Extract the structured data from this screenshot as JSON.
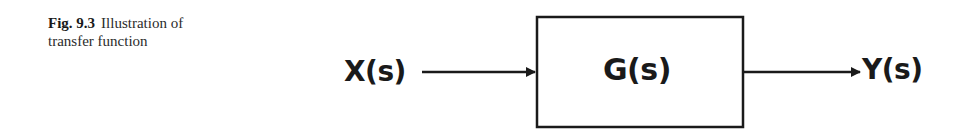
{
  "caption": {
    "label": "Fig. 9.3",
    "text_line1": "Illustration of",
    "text_line2": "transfer function"
  },
  "diagram": {
    "input_label": "X(s)",
    "block_label": "G(s)",
    "output_label": "Y(s)",
    "line_color": "#1a1a1a"
  }
}
